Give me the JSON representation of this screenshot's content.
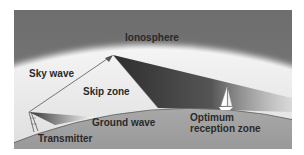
{
  "diagram": {
    "labels": {
      "ionosphere": "Ionosphere",
      "sky_wave": "Sky wave",
      "skip_zone": "Skip zone",
      "ground_wave": "Ground wave",
      "transmitter": "Transmitter",
      "optimum_line1": "Optimum",
      "optimum_line2": "reception zone"
    },
    "colors": {
      "ionosphere": "#6e6e6e",
      "sky": "#e2e2e2",
      "earth": "#9c9c9c",
      "wave_shadow": "#3a3a3a",
      "text": "#2a2a2a"
    }
  }
}
